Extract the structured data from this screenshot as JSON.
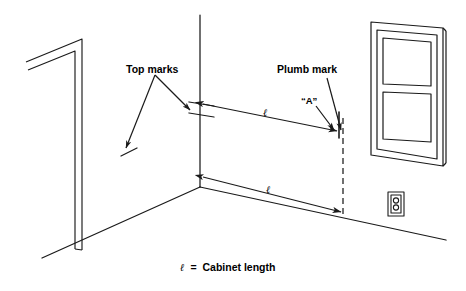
{
  "figure": {
    "type": "technical-line-drawing",
    "background_color": "#ffffff",
    "line_color": "#1a1a1a"
  },
  "labels": {
    "top_marks": "Top marks",
    "plumb_mark": "Plumb mark",
    "a_mark": "“A”",
    "dimension_upper": "ℓ",
    "dimension_lower": "ℓ"
  },
  "caption": {
    "symbol": "ℓ",
    "equals": "=",
    "text": "Cabinet length",
    "full": "ℓ = Cabinet length"
  },
  "scene_elements": {
    "door_opening": "door-jamb-left-wall",
    "corner": "wall-corner-vertical",
    "window": "double-hung-window-two-panes",
    "outlet": "duplex-electrical-outlet",
    "plumb_line": "dashed-vertical-plumb-line",
    "floor_line": "floor-baseline"
  }
}
